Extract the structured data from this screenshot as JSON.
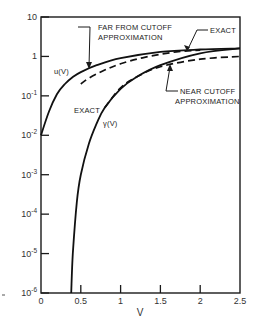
{
  "chart_data": {
    "type": "line",
    "title": "",
    "xlabel": "V",
    "ylabel": "",
    "xlim": [
      0,
      2.5
    ],
    "ylim": [
      1e-06,
      10
    ],
    "yscale": "log",
    "grid": false,
    "x_ticks": [
      "0",
      "0.5",
      "1",
      "1.5",
      "2",
      "2.5"
    ],
    "y_ticks": [
      "10",
      "1",
      "10-1",
      "10-2",
      "10-3",
      "10-4",
      "10-5",
      "10-6"
    ],
    "series": [
      {
        "name": "u(V) exact",
        "style": "solid",
        "x": [
          0.0,
          0.1,
          0.2,
          0.3,
          0.4,
          0.5,
          0.7,
          1.0,
          1.5,
          2.0,
          2.5
        ],
        "y": [
          0.01,
          0.04,
          0.11,
          0.2,
          0.3,
          0.4,
          0.6,
          0.9,
          1.3,
          1.5,
          1.6
        ]
      },
      {
        "name": "u(V) far from cutoff approximation",
        "style": "dashed",
        "x": [
          0.5,
          0.6,
          0.8,
          1.0,
          1.3,
          1.7,
          2.0
        ],
        "y": [
          0.2,
          0.28,
          0.45,
          0.65,
          0.95,
          1.3,
          1.45
        ]
      },
      {
        "name": "γ(V) exact",
        "style": "solid",
        "x": [
          0.38,
          0.4,
          0.45,
          0.5,
          0.6,
          0.7,
          0.8,
          1.0,
          1.2,
          1.5,
          2.0,
          2.5
        ],
        "y": [
          1e-06,
          1e-05,
          0.0002,
          0.001,
          0.006,
          0.02,
          0.05,
          0.15,
          0.3,
          0.6,
          1.2,
          1.6
        ]
      },
      {
        "name": "γ(V) near cutoff approximation",
        "style": "dashed",
        "x": [
          0.8,
          1.0,
          1.2,
          1.5,
          2.0,
          2.5
        ],
        "y": [
          0.05,
          0.16,
          0.3,
          0.55,
          0.85,
          1.0
        ]
      }
    ],
    "annotations": [
      {
        "text": "FAR FROM CUTOFF",
        "text2": "APPROXIMATION",
        "target": "u(V) far from cutoff approximation"
      },
      {
        "text": "EXACT",
        "target": "u(V) exact (upper right)"
      },
      {
        "text": "NEAR CUTOFF",
        "text2": "APPROXIMATION",
        "target": "γ(V) near cutoff approximation"
      },
      {
        "text": "EXACT",
        "target": "γ(V) exact"
      },
      {
        "text": "u(V)",
        "target": "u curve label"
      },
      {
        "text": "γ(V)",
        "target": "γ curve label"
      }
    ]
  },
  "labels": {
    "x_axis_title": "V",
    "far_line1": "FAR FROM CUTOFF",
    "far_line2": "APPROXIMATION",
    "exact_top": "EXACT",
    "near_line1": "NEAR CUTOFF",
    "near_line2": "APPROXIMATION",
    "exact_mid": "EXACT",
    "u_label": "u(V)",
    "gamma_label": "γ(V)"
  },
  "x_ticks": [
    {
      "label": "0",
      "v": 0
    },
    {
      "label": "0.5",
      "v": 0.5
    },
    {
      "label": "1",
      "v": 1
    },
    {
      "label": "1.5",
      "v": 1.5
    },
    {
      "label": "2",
      "v": 2
    },
    {
      "label": "2.5",
      "v": 2.5
    }
  ],
  "y_ticks": [
    {
      "base": "10",
      "exp": "",
      "e": 1
    },
    {
      "base": "1",
      "exp": "",
      "e": 0
    },
    {
      "base": "10",
      "exp": "-1",
      "e": -1
    },
    {
      "base": "10",
      "exp": "-2",
      "e": -2
    },
    {
      "base": "10",
      "exp": "-3",
      "e": -3
    },
    {
      "base": "10",
      "exp": "-4",
      "e": -4
    },
    {
      "base": "10",
      "exp": "-5",
      "e": -5
    },
    {
      "base": "10",
      "exp": "-6",
      "e": -6
    }
  ]
}
